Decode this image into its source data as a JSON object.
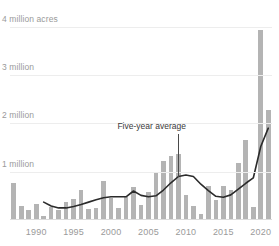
{
  "chart_data": {
    "type": "bar",
    "title": "",
    "subtitle": "",
    "xlabel": "",
    "ylabel": "",
    "ylim": [
      0,
      4200000
    ],
    "xlim": [
      1986.5,
      2021.5
    ],
    "grid": true,
    "legend_position": "none",
    "y_ticks": [
      1000000,
      2000000,
      3000000,
      4000000
    ],
    "y_tick_labels": [
      "1 million",
      "2 million",
      "3 million",
      "4 million acres"
    ],
    "x_ticks": [
      1990,
      1995,
      2000,
      2005,
      2010,
      2015,
      2020
    ],
    "x_tick_labels": [
      "1990",
      "1995",
      "2000",
      "2005",
      "2010",
      "2015",
      "2020"
    ],
    "bar_color": "#b4b4b4",
    "line_color": "#2b2b2b",
    "categories": [
      1987,
      1988,
      1989,
      1990,
      1991,
      1992,
      1993,
      1994,
      1995,
      1996,
      1997,
      1998,
      1999,
      2000,
      2001,
      2002,
      2003,
      2004,
      2005,
      2006,
      2007,
      2008,
      2009,
      2010,
      2011,
      2012,
      2013,
      2014,
      2015,
      2016,
      2017,
      2018,
      2019,
      2020,
      2021
    ],
    "series": [
      {
        "name": "Acres burned",
        "type": "bar",
        "values": [
          760000,
          300000,
          200000,
          330000,
          90000,
          270000,
          200000,
          380000,
          430000,
          620000,
          230000,
          250000,
          810000,
          450000,
          250000,
          480000,
          690000,
          320000,
          580000,
          980000,
          1230000,
          1330000,
          1370000,
          520000,
          280000,
          120000,
          700000,
          420000,
          700000,
          620000,
          1180000,
          1650000,
          270000,
          3930000,
          2270000
        ]
      },
      {
        "name": "Five-year average",
        "type": "line",
        "x": [
          1991,
          1992,
          1993,
          1994,
          1995,
          1996,
          1997,
          1998,
          1999,
          2000,
          2001,
          2002,
          2003,
          2004,
          2005,
          2006,
          2007,
          2008,
          2009,
          2010,
          2011,
          2012,
          2013,
          2014,
          2015,
          2016,
          2017,
          2018,
          2019,
          2020,
          2021
        ],
        "values": [
          370000,
          290000,
          250000,
          250000,
          280000,
          320000,
          370000,
          420000,
          460000,
          480000,
          480000,
          480000,
          600000,
          510000,
          480000,
          500000,
          620000,
          770000,
          900000,
          930000,
          900000,
          740000,
          610000,
          490000,
          470000,
          520000,
          640000,
          760000,
          870000,
          1520000,
          1900000
        ]
      }
    ],
    "annotations": [
      {
        "label": "Five-year average",
        "target_x": 2009,
        "target_value": 900000
      }
    ]
  }
}
